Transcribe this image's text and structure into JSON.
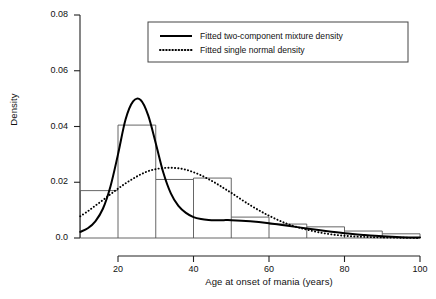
{
  "chart_data": {
    "type": "area",
    "title": "",
    "subtitle": "",
    "xlabel": "Age at onset of mania (years)",
    "ylabel": "Density",
    "xlim": [
      10,
      100
    ],
    "ylim": [
      0.0,
      0.08
    ],
    "grid": false,
    "legend_position": "top-center",
    "x_ticks": [
      {
        "value": 20,
        "label": "20"
      },
      {
        "value": 40,
        "label": "40"
      },
      {
        "value": 60,
        "label": "60"
      },
      {
        "value": 80,
        "label": "80"
      },
      {
        "value": 100,
        "label": "100"
      }
    ],
    "y_ticks": [
      {
        "value": 0.0,
        "label": "0.0"
      },
      {
        "value": 0.02,
        "label": "0.02"
      },
      {
        "value": 0.04,
        "label": "0.04"
      },
      {
        "value": 0.06,
        "label": "0.06"
      },
      {
        "value": 0.08,
        "label": "0.08"
      }
    ],
    "histogram": {
      "name": "Observed age at onset histogram",
      "bin_width": 10,
      "bin_edges": [
        10,
        20,
        30,
        40,
        50,
        60,
        70,
        80,
        90
      ],
      "densities": [
        0.017,
        0.0405,
        0.021,
        0.0215,
        0.0075,
        0.005,
        0.004,
        0.0025,
        0.0015
      ],
      "line_color": "#555555",
      "fill": "none"
    },
    "series": [
      {
        "name": "Fitted two-component mixture density",
        "style": "solid",
        "color": "#000000",
        "x": [
          10,
          12,
          14,
          16,
          18,
          20,
          22,
          24,
          26,
          28,
          30,
          32,
          34,
          36,
          38,
          40,
          42,
          44,
          46,
          48,
          50,
          55,
          60,
          65,
          70,
          75,
          80,
          85,
          90,
          95,
          100
        ],
        "y": [
          0.0022,
          0.0035,
          0.006,
          0.0105,
          0.0185,
          0.03,
          0.0425,
          0.049,
          0.0495,
          0.044,
          0.034,
          0.0235,
          0.016,
          0.0115,
          0.009,
          0.0075,
          0.0068,
          0.0065,
          0.0064,
          0.0064,
          0.0064,
          0.006,
          0.0053,
          0.0044,
          0.0034,
          0.0025,
          0.0017,
          0.0011,
          0.0006,
          0.0003,
          0.0002
        ]
      },
      {
        "name": "Fitted single normal density",
        "style": "dotted",
        "color": "#000000",
        "x": [
          10,
          12,
          14,
          16,
          18,
          20,
          22,
          24,
          26,
          28,
          30,
          32,
          34,
          36,
          38,
          40,
          42,
          44,
          46,
          48,
          50,
          55,
          60,
          65,
          70,
          75,
          80,
          85,
          90,
          95,
          100
        ],
        "y": [
          0.0078,
          0.0096,
          0.0116,
          0.0136,
          0.0157,
          0.0177,
          0.0196,
          0.0213,
          0.0228,
          0.024,
          0.0247,
          0.0251,
          0.0252,
          0.025,
          0.0245,
          0.0236,
          0.0225,
          0.0211,
          0.0196,
          0.0179,
          0.0162,
          0.0118,
          0.008,
          0.005,
          0.003,
          0.0016,
          0.0008,
          0.0004,
          0.0002,
          0.0001,
          0.0
        ]
      }
    ]
  },
  "legend": {
    "entries": [
      {
        "label": "Fitted two-component mixture density",
        "style": "solid"
      },
      {
        "label": "Fitted single normal density",
        "style": "dotted"
      }
    ]
  }
}
